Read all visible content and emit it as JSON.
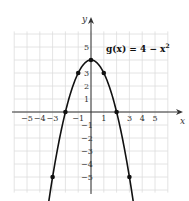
{
  "chart_data": {
    "type": "line",
    "title": "",
    "function_label": "g(x) = 4 − x²",
    "equation_parts": {
      "prefix": "g(x) = 4 − x",
      "exponent": "2"
    },
    "xlabel": "x",
    "ylabel": "y",
    "xlim": [
      -6,
      6
    ],
    "ylim": [
      -6,
      6
    ],
    "x_ticks": [
      "−5",
      "−4",
      "−3",
      "−1",
      "1",
      "3",
      "4",
      "5"
    ],
    "y_ticks": [
      "5",
      "3",
      "2",
      "1",
      "−1",
      "−2",
      "−3",
      "−4",
      "−5"
    ],
    "grid": true,
    "points": [
      {
        "x": -3,
        "y": -5
      },
      {
        "x": -2,
        "y": 0
      },
      {
        "x": -1,
        "y": 3
      },
      {
        "x": 0,
        "y": 4
      },
      {
        "x": 1,
        "y": 3
      },
      {
        "x": 2,
        "y": 0
      },
      {
        "x": 3,
        "y": -5
      }
    ]
  }
}
